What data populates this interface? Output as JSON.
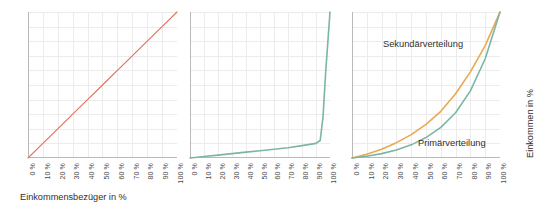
{
  "figure": {
    "background": "#ffffff",
    "grid_color": "#ececec",
    "axis_color": "#b9b9b9",
    "text_color": "#2f2f2f"
  },
  "axis": {
    "tick_labels": [
      "0 %",
      "10 %",
      "20 %",
      "30 %",
      "40 %",
      "50 %",
      "60 %",
      "70 %",
      "80 %",
      "90 %",
      "100 %"
    ],
    "xlabel": "Einkommensbezüger in %",
    "ylabel": "Einkommen in %"
  },
  "labels": {
    "sekundaer": "Sekundärverteilung",
    "primaer": "Primärverteilung"
  },
  "colors": {
    "equality_line": "#e0705c",
    "primary_curve": "#7bb6a5",
    "secondary_curve": "#eaa94f"
  },
  "chart_data": [
    {
      "type": "line",
      "title": "",
      "panel": 1,
      "xlabel": "Einkommensbezüger in %",
      "ylabel": "",
      "xlim": [
        0,
        100
      ],
      "ylim": [
        0,
        100
      ],
      "grid": true,
      "legend": "none",
      "series": [
        {
          "name": "Gleichverteilung",
          "color": "#e0705c",
          "x": [
            0,
            10,
            20,
            30,
            40,
            50,
            60,
            70,
            80,
            90,
            100
          ],
          "values": [
            0,
            10,
            20,
            30,
            40,
            50,
            60,
            70,
            80,
            90,
            100
          ]
        }
      ]
    },
    {
      "type": "line",
      "title": "",
      "panel": 2,
      "xlabel": "",
      "ylabel": "",
      "xlim": [
        0,
        100
      ],
      "ylim": [
        0,
        100
      ],
      "grid": true,
      "legend": "none",
      "series": [
        {
          "name": "Vollkommene Ungleichverteilung",
          "color": "#7bb6a5",
          "x": [
            0,
            10,
            20,
            30,
            40,
            50,
            60,
            70,
            80,
            90,
            93,
            95,
            97,
            100
          ],
          "values": [
            0,
            1,
            2,
            3,
            4,
            5,
            6,
            7,
            8.5,
            10,
            12,
            28,
            60,
            100
          ]
        }
      ]
    },
    {
      "type": "line",
      "title": "",
      "panel": 3,
      "xlabel": "",
      "ylabel": "Einkommen in %",
      "xlim": [
        0,
        100
      ],
      "ylim": [
        0,
        100
      ],
      "grid": true,
      "legend": "inline-annotations",
      "annotations": [
        {
          "text": "Sekundärverteilung",
          "x": 28,
          "y": 80
        },
        {
          "text": "Primärverteilung",
          "x": 52,
          "y": 16
        }
      ],
      "series": [
        {
          "name": "Sekundärverteilung",
          "color": "#eaa94f",
          "x": [
            0,
            10,
            20,
            30,
            40,
            50,
            60,
            70,
            80,
            90,
            100
          ],
          "values": [
            0,
            2.5,
            6,
            10.5,
            16,
            23,
            32,
            44,
            59,
            77,
            100
          ]
        },
        {
          "name": "Primärverteilung",
          "color": "#7bb6a5",
          "x": [
            0,
            10,
            20,
            30,
            40,
            50,
            60,
            70,
            80,
            90,
            100
          ],
          "values": [
            0,
            1.2,
            3,
            5.5,
            9,
            14,
            21,
            31,
            46,
            68,
            100
          ]
        }
      ]
    }
  ]
}
